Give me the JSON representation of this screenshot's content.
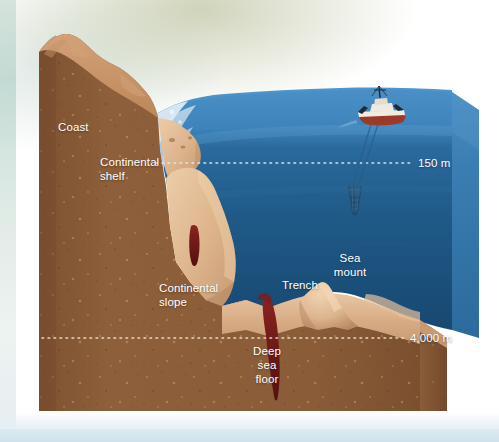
{
  "diagram": {
    "labels": {
      "coast": "Coast",
      "continental_shelf_line1": "Continental",
      "continental_shelf_line2": "shelf",
      "continental_slope_line1": "Continental",
      "continental_slope_line2": "slope",
      "trench": "Trench",
      "sea_mount_line1": "Sea",
      "sea_mount_line2": "mount",
      "deep_sea_floor_line1": "Deep",
      "deep_sea_floor_line2": "sea",
      "deep_sea_floor_line3": "floor"
    },
    "depth_markers": [
      {
        "name": "shelf-break-depth",
        "value": "150 m"
      },
      {
        "name": "abyssal-plain-depth",
        "value": "4,000 m"
      }
    ],
    "objects": [
      {
        "name": "research-vessel",
        "kind": "ship-icon"
      },
      {
        "name": "trawl-net",
        "kind": "net-icon"
      },
      {
        "name": "tow-cable",
        "kind": "cable"
      }
    ],
    "colors": {
      "background": "#ffffff",
      "background_tint": "#a8b082",
      "water_surface": "#3f86bd",
      "water_deep": "#17486f",
      "water_side_face": "#2f78ae",
      "earth_brown": "#8a5c38",
      "earth_brown_dark": "#7a4f2e",
      "seafloor_tan": "#d5a982",
      "seafloor_tan_light": "#e7c3a0",
      "crack_red": "#6e1a18",
      "surf_white": "#ffffff",
      "label_text": "#ffffff"
    }
  }
}
